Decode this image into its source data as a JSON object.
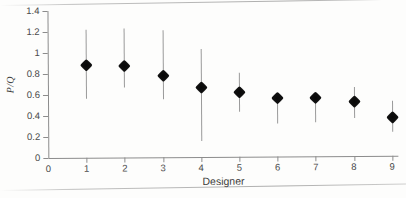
{
  "figure": {
    "y_axis_title": "P/Q",
    "x_axis_title": "Designer",
    "y_ticks": [
      "0",
      "0.2",
      "0.4",
      "0.6",
      "0.8",
      "1",
      "1.2",
      "1.4"
    ],
    "x_ticks": [
      "0",
      "1",
      "2",
      "3",
      "4",
      "5",
      "6",
      "7",
      "8",
      "9"
    ],
    "marker_color": "#111111",
    "errorbar_color": "#9a9a9a",
    "axis_color": "#8c8c8c",
    "background_color": "#fdfdfc"
  },
  "chart_data": {
    "type": "scatter",
    "title": "",
    "subtitle": "",
    "xlabel": "Designer",
    "ylabel": "P/Q",
    "xlim": [
      0,
      9.4
    ],
    "ylim": [
      0,
      1.4
    ],
    "grid": false,
    "legend": null,
    "x": [
      1,
      2,
      3,
      4,
      5,
      6,
      7,
      8,
      9
    ],
    "values": [
      0.89,
      0.88,
      0.78,
      0.67,
      0.62,
      0.56,
      0.56,
      0.52,
      0.37
    ],
    "error_low": [
      0.56,
      0.67,
      0.55,
      0.15,
      0.43,
      0.31,
      0.32,
      0.36,
      0.23
    ],
    "error_high": [
      1.22,
      1.23,
      1.21,
      1.03,
      0.8,
      0.58,
      0.57,
      0.66,
      0.52
    ],
    "series": [
      {
        "name": "P/Q estimate",
        "marker": "filled-diamond",
        "points": [
          {
            "x": 1,
            "y": 0.89,
            "low": 0.56,
            "high": 1.22
          },
          {
            "x": 2,
            "y": 0.88,
            "low": 0.67,
            "high": 1.23
          },
          {
            "x": 3,
            "y": 0.78,
            "low": 0.55,
            "high": 1.21
          },
          {
            "x": 4,
            "y": 0.67,
            "low": 0.15,
            "high": 1.03
          },
          {
            "x": 5,
            "y": 0.62,
            "low": 0.43,
            "high": 0.8
          },
          {
            "x": 6,
            "y": 0.56,
            "low": 0.31,
            "high": 0.58
          },
          {
            "x": 7,
            "y": 0.56,
            "low": 0.32,
            "high": 0.57
          },
          {
            "x": 8,
            "y": 0.52,
            "low": 0.36,
            "high": 0.66
          },
          {
            "x": 9,
            "y": 0.37,
            "low": 0.23,
            "high": 0.52
          }
        ]
      }
    ]
  }
}
